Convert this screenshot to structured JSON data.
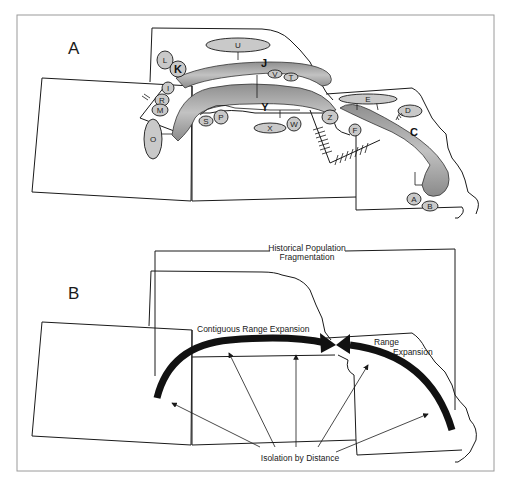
{
  "panels": {
    "a": {
      "label": "A",
      "major_ranges": [
        "J",
        "Y",
        "C"
      ],
      "populations": [
        "U",
        "L",
        "K",
        "I",
        "R",
        "M",
        "O",
        "S",
        "P",
        "V",
        "T",
        "X",
        "W",
        "Z",
        "E",
        "D",
        "F",
        "A",
        "B"
      ]
    },
    "b": {
      "label": "B",
      "annotations": {
        "fragmentation_line1": "Historical Population",
        "fragmentation_line2": "Fragmentation",
        "contiguous": "Contiguous Range Expansion",
        "range_line1": "Range",
        "range_line2": "Expansion",
        "isolation": "Isolation by Distance"
      }
    }
  },
  "colors": {
    "line": "#1a1a1a",
    "range_fill": "#b0b0b0",
    "oval_fill": "#c9c9c9",
    "frame": "#9a9a9a",
    "arrow": "#111111"
  }
}
